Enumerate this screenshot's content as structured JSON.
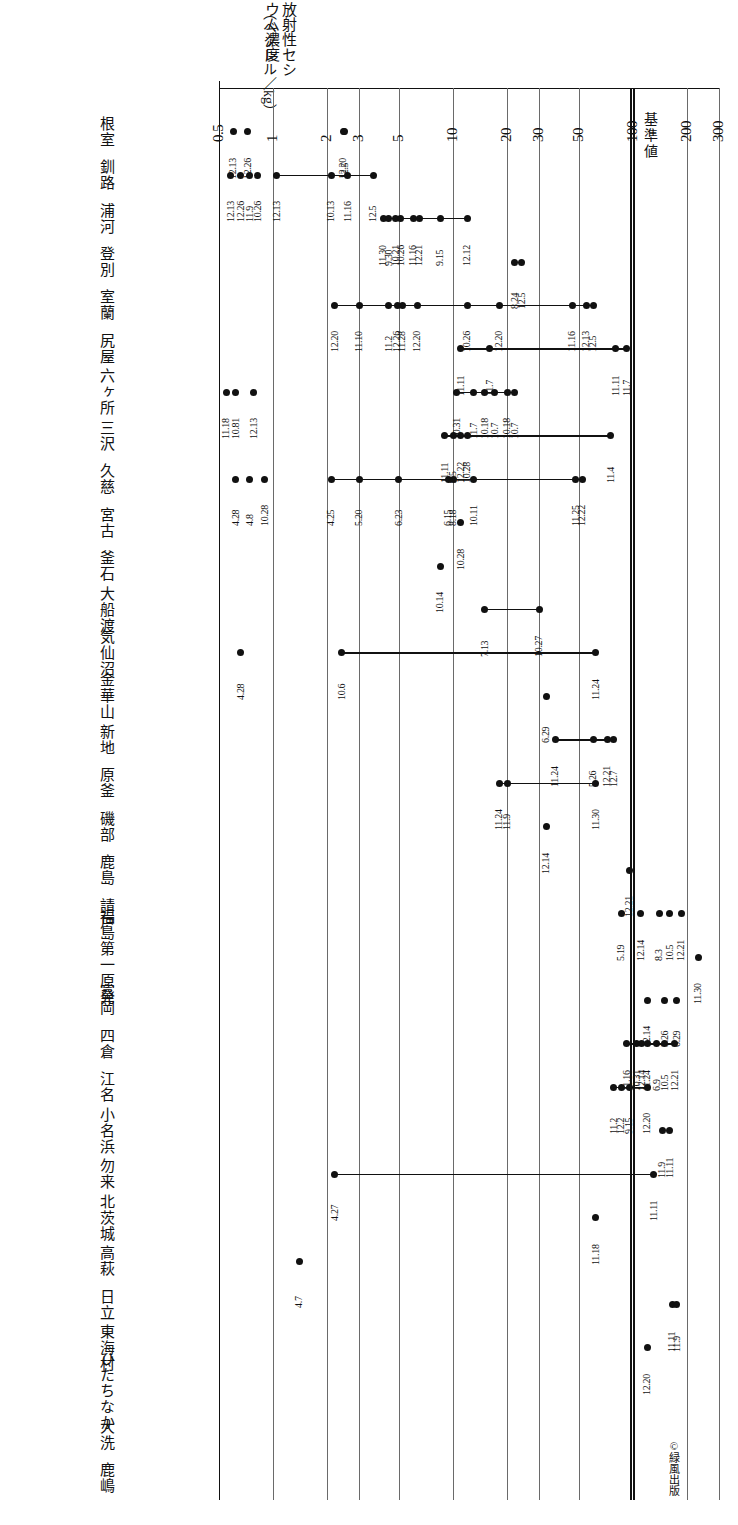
{
  "chart_data": {
    "type": "scatter",
    "title": "",
    "orientation": "rotated-90-cw",
    "xlabel": "",
    "ylabel": "放射性セシウム濃度（ベクレル／kg）",
    "axis_title_main": "放射性セシウム濃度",
    "axis_title_unit": "（ベクレル／kg）",
    "scale": "log",
    "xlim": [
      0.5,
      300
    ],
    "ticks": [
      {
        "value": 0.5,
        "label": "0.5"
      },
      {
        "value": 1,
        "label": "1"
      },
      {
        "value": 2,
        "label": "2"
      },
      {
        "value": 3,
        "label": "3"
      },
      {
        "value": 5,
        "label": "5"
      },
      {
        "value": 10,
        "label": "10"
      },
      {
        "value": 20,
        "label": "20"
      },
      {
        "value": 30,
        "label": "30"
      },
      {
        "value": 50,
        "label": "50"
      },
      {
        "value": 100,
        "label": "100"
      },
      {
        "value": 200,
        "label": "200"
      },
      {
        "value": 300,
        "label": "300"
      }
    ],
    "reference_line": {
      "label": "基準値",
      "value": 100
    },
    "grid": true,
    "legend": "none",
    "categories": [
      "根室",
      "釧路",
      "浦河",
      "登別",
      "室蘭",
      "尻屋",
      "六ヶ所",
      "三沢",
      "久慈",
      "宮古",
      "釜石",
      "大船渡",
      "気仙沼",
      "金華山",
      "新地",
      "原釜",
      "磯部",
      "鹿島",
      "請戸",
      "福島第一原発",
      "富岡",
      "四倉",
      "江名",
      "小名浜",
      "勿来",
      "北茨城",
      "高萩",
      "日立",
      "東海村",
      "ひたちなか",
      "大洗",
      "鹿嶋"
    ],
    "series": [
      {
        "category": "根室",
        "points": [
          {
            "value": 0.6,
            "date": "12.13"
          },
          {
            "value": 0.72,
            "date": "12.26"
          },
          {
            "value": 2.5,
            "date": "12.5"
          },
          {
            "value": 2.45,
            "date": "12.20"
          }
        ],
        "connect": [
          [
            2,
            3
          ]
        ]
      },
      {
        "category": "釧路",
        "points": [
          {
            "value": 0.58,
            "date": "12.13"
          },
          {
            "value": 0.66,
            "date": "12.26"
          },
          {
            "value": 0.74,
            "date": "11.9"
          },
          {
            "value": 0.82,
            "date": "10.26"
          },
          {
            "value": 1.05,
            "date": "12.13"
          },
          {
            "value": 2.1,
            "date": "10.13"
          },
          {
            "value": 2.6,
            "date": "11.16"
          },
          {
            "value": 3.6,
            "date": "12.5"
          }
        ],
        "connect": [
          [
            4,
            7
          ]
        ]
      },
      {
        "category": "浦河",
        "points": [
          {
            "value": 4.1,
            "date": "11.30"
          },
          {
            "value": 4.4,
            "date": "9.30"
          },
          {
            "value": 4.8,
            "date": "10.21"
          },
          {
            "value": 5.1,
            "date": "10.26"
          },
          {
            "value": 6.0,
            "date": "11.16"
          },
          {
            "value": 6.5,
            "date": "12.21"
          },
          {
            "value": 8.5,
            "date": "9.15"
          },
          {
            "value": 12.0,
            "date": "12.12"
          }
        ],
        "connect": [
          [
            0,
            7
          ]
        ]
      },
      {
        "category": "登別",
        "points": [
          {
            "value": 22,
            "date": "8.24"
          },
          {
            "value": 24,
            "date": "12.5"
          }
        ],
        "connect": []
      },
      {
        "category": "室蘭",
        "points": [
          {
            "value": 2.2,
            "date": "12.20"
          },
          {
            "value": 3.0,
            "date": "11.10"
          },
          {
            "value": 4.4,
            "date": "11.2"
          },
          {
            "value": 4.9,
            "date": "12.26"
          },
          {
            "value": 5.2,
            "date": "11.28"
          },
          {
            "value": 6.3,
            "date": "12.20"
          },
          {
            "value": 12,
            "date": "10.26"
          },
          {
            "value": 18,
            "date": "12.20"
          },
          {
            "value": 46,
            "date": "11.16"
          },
          {
            "value": 55,
            "date": "12.13"
          },
          {
            "value": 60,
            "date": "12.5"
          }
        ],
        "connect": [
          [
            0,
            10
          ]
        ]
      },
      {
        "category": "尻屋",
        "points": [
          {
            "value": 11,
            "date": "11.11"
          },
          {
            "value": 16,
            "date": "11.7"
          },
          {
            "value": 80,
            "date": "11.11"
          },
          {
            "value": 92,
            "date": "11.7"
          }
        ],
        "connect": [
          [
            0,
            3
          ]
        ]
      },
      {
        "category": "六ヶ所",
        "points": [
          {
            "value": 0.55,
            "date": "11.18"
          },
          {
            "value": 0.62,
            "date": "10.81"
          },
          {
            "value": 0.78,
            "date": "12.13"
          },
          {
            "value": 10.5,
            "date": "10.31"
          },
          {
            "value": 13,
            "date": "11.7"
          },
          {
            "value": 15,
            "date": "10.18"
          },
          {
            "value": 17,
            "date": "10.7"
          },
          {
            "value": 20,
            "date": "10.18"
          },
          {
            "value": 22,
            "date": "10.7"
          }
        ],
        "connect": [
          [
            3,
            8
          ]
        ]
      },
      {
        "category": "三沢",
        "points": [
          {
            "value": 9.0,
            "date": "11.11"
          },
          {
            "value": 10,
            "date": "9.5"
          },
          {
            "value": 11,
            "date": "12.22"
          },
          {
            "value": 12,
            "date": "10.28"
          },
          {
            "value": 75,
            "date": "11.4"
          }
        ],
        "connect": [
          [
            0,
            4
          ]
        ]
      },
      {
        "category": "久慈",
        "points": [
          {
            "value": 0.62,
            "date": "4.28"
          },
          {
            "value": 0.74,
            "date": "4.8"
          },
          {
            "value": 0.9,
            "date": "10.28"
          },
          {
            "value": 2.1,
            "date": "4.25"
          },
          {
            "value": 3.0,
            "date": "5.20"
          },
          {
            "value": 5.0,
            "date": "6.23"
          },
          {
            "value": 9.4,
            "date": "6.15"
          },
          {
            "value": 10,
            "date": "8.18"
          },
          {
            "value": 13,
            "date": "10.11"
          },
          {
            "value": 48,
            "date": "11.25"
          },
          {
            "value": 52,
            "date": "12.22"
          }
        ],
        "connect": [
          [
            3,
            10
          ]
        ]
      },
      {
        "category": "宮古",
        "points": [
          {
            "value": 11,
            "date": "10.28"
          }
        ],
        "connect": []
      },
      {
        "category": "釜石",
        "points": [
          {
            "value": 8.5,
            "date": "10.14"
          }
        ],
        "connect": []
      },
      {
        "category": "大船渡",
        "points": [
          {
            "value": 15,
            "date": "7.13"
          },
          {
            "value": 30,
            "date": "10.27"
          }
        ],
        "connect": [
          [
            0,
            1
          ]
        ]
      },
      {
        "category": "気仙沼",
        "points": [
          {
            "value": 0.66,
            "date": "4.28"
          },
          {
            "value": 2.4,
            "date": "10.6"
          },
          {
            "value": 62,
            "date": "11.24"
          }
        ],
        "connect": [
          [
            1,
            2
          ]
        ]
      },
      {
        "category": "金華山",
        "points": [
          {
            "value": 33,
            "date": "6.29"
          }
        ],
        "connect": []
      },
      {
        "category": "新地",
        "points": [
          {
            "value": 37,
            "date": "11.24"
          },
          {
            "value": 60,
            "date": "5.26"
          },
          {
            "value": 72,
            "date": "12.21"
          },
          {
            "value": 78,
            "date": "12.7"
          }
        ],
        "connect": [
          [
            0,
            3
          ]
        ]
      },
      {
        "category": "原釜",
        "points": [
          {
            "value": 18,
            "date": "11.24"
          },
          {
            "value": 20,
            "date": "11.9"
          },
          {
            "value": 62,
            "date": "11.30"
          }
        ],
        "connect": [
          [
            0,
            2
          ]
        ]
      },
      {
        "category": "磯部",
        "points": [
          {
            "value": 33,
            "date": "12.14"
          }
        ],
        "connect": []
      },
      {
        "category": "鹿島",
        "points": [
          {
            "value": 95,
            "date": "12.21"
          }
        ],
        "connect": []
      },
      {
        "category": "請戸",
        "points": [
          {
            "value": 86,
            "date": "5.19"
          },
          {
            "value": 110,
            "date": "12.14"
          },
          {
            "value": 140,
            "date": "8.3"
          },
          {
            "value": 160,
            "date": "10.5"
          },
          {
            "value": 185,
            "date": "12.21"
          }
        ],
        "connect": []
      },
      {
        "category": "福島第一原発",
        "points": [
          {
            "value": 230,
            "date": "11.30"
          }
        ],
        "connect": []
      },
      {
        "category": "富岡",
        "points": [
          {
            "value": 120,
            "date": "12.14"
          },
          {
            "value": 150,
            "date": "5.26"
          },
          {
            "value": 175,
            "date": "6.29"
          }
        ],
        "connect": []
      },
      {
        "category": "四倉",
        "points": [
          {
            "value": 92,
            "date": "11.16"
          },
          {
            "value": 105,
            "date": "10.31"
          },
          {
            "value": 112,
            "date": "12.14"
          },
          {
            "value": 120,
            "date": "11.24"
          },
          {
            "value": 135,
            "date": "6.9"
          },
          {
            "value": 150,
            "date": "10.5"
          },
          {
            "value": 170,
            "date": "12.21"
          }
        ],
        "connect": [
          [
            0,
            6
          ]
        ]
      },
      {
        "category": "江名",
        "points": [
          {
            "value": 78,
            "date": "11.2"
          },
          {
            "value": 86,
            "date": "12.2"
          },
          {
            "value": 95,
            "date": "9.15"
          },
          {
            "value": 120,
            "date": "12.20"
          }
        ],
        "connect": [
          [
            0,
            3
          ]
        ]
      },
      {
        "category": "小名浜",
        "points": [
          {
            "value": 145,
            "date": "11.9"
          },
          {
            "value": 160,
            "date": "11.11"
          }
        ],
        "connect": []
      },
      {
        "category": "勿来",
        "points": [
          {
            "value": 2.2,
            "date": "4.27"
          },
          {
            "value": 130,
            "date": "11.11"
          }
        ],
        "connect": [
          [
            0,
            1
          ]
        ]
      },
      {
        "category": "北茨城",
        "points": [
          {
            "value": 62,
            "date": "11.18"
          }
        ],
        "connect": []
      },
      {
        "category": "高萩",
        "points": [
          {
            "value": 1.4,
            "date": "4.7"
          }
        ],
        "connect": []
      },
      {
        "category": "日立",
        "points": [
          {
            "value": 165,
            "date": "11.11"
          },
          {
            "value": 175,
            "date": "11.9"
          }
        ],
        "connect": []
      },
      {
        "category": "東海村",
        "points": [
          {
            "value": 120,
            "date": "12.20"
          }
        ],
        "connect": []
      }
    ]
  },
  "annotations": {
    "standard_value_label": "基準値",
    "copyright": "©緑風出版"
  },
  "axis": {
    "title_main": "放射性セシウム濃度",
    "title_unit": "（ベクレル／kg）"
  },
  "places": [
    {
      "label": "根室"
    },
    {
      "label": "釧路"
    },
    {
      "label": "浦河"
    },
    {
      "label": "登別"
    },
    {
      "label": "室蘭"
    },
    {
      "label": "尻屋"
    },
    {
      "label": "六ヶ所"
    },
    {
      "label": "三沢"
    },
    {
      "label": "久慈"
    },
    {
      "label": "宮古"
    },
    {
      "label": "釜石"
    },
    {
      "label": "大船渡"
    },
    {
      "label": "気仙沼"
    },
    {
      "label": "金華山"
    },
    {
      "label": "新地"
    },
    {
      "label": "原釜"
    },
    {
      "label": "磯部"
    },
    {
      "label": "鹿島"
    },
    {
      "label": "請戸"
    },
    {
      "label": "福島第一原発"
    },
    {
      "label": "富岡"
    },
    {
      "label": "四倉"
    },
    {
      "label": "江名"
    },
    {
      "label": "小名浜"
    },
    {
      "label": "勿来"
    },
    {
      "label": "北茨城"
    },
    {
      "label": "高萩"
    },
    {
      "label": "日立"
    },
    {
      "label": "東海村"
    },
    {
      "label": "ひたちなか"
    },
    {
      "label": "大洗"
    },
    {
      "label": "鹿嶋"
    }
  ]
}
